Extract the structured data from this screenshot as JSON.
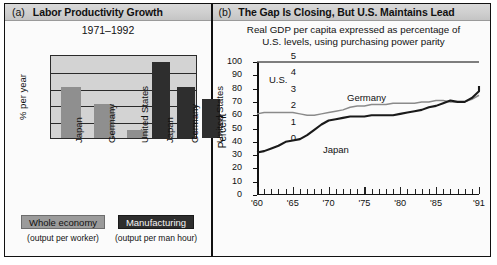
{
  "panel_a": {
    "letter": "(a)",
    "title": "Labor Productivity Growth",
    "subtitle": "1971–1992",
    "legend": {
      "whole_label": "Whole economy",
      "whole_sub": "(output per worker)",
      "manufacturing_label": "Manufacturing",
      "manufacturing_sub": "(output per man hour)"
    },
    "colors": {
      "whole": "#8f8f8f",
      "manufacturing": "#2e2e2e",
      "plot_bg": "#d3d3d3"
    }
  },
  "panel_b": {
    "letter": "(b)",
    "title": "The Gap Is Closing, But U.S. Maintains Lead",
    "subtitle_line1": "Real GDP per capita expressed as percentage of",
    "subtitle_line2": "U.S. levels, using purchasing power parity",
    "series_labels": {
      "us": "U.S.",
      "germany": "Germany",
      "japan": "Japan"
    }
  },
  "chart_data": [
    {
      "type": "bar",
      "title": "Labor Productivity Growth",
      "subtitle": "1971–1992",
      "xlabel": "",
      "ylabel": "% per year",
      "ylim": [
        0,
        5
      ],
      "yticks": [
        0,
        1,
        2,
        3,
        4,
        5
      ],
      "grid": true,
      "legend_position": "below",
      "categories": [
        "Japan",
        "Germany",
        "United States",
        "Japan",
        "Germany",
        "United States"
      ],
      "groups": [
        "Whole economy",
        "Whole economy",
        "Whole economy",
        "Manufacturing",
        "Manufacturing",
        "Manufacturing"
      ],
      "values": [
        3.05,
        2.0,
        0.45,
        4.5,
        3.05,
        2.3
      ],
      "series": [
        {
          "name": "Whole economy",
          "categories": [
            "Japan",
            "Germany",
            "United States"
          ],
          "values": [
            3.05,
            2.0,
            0.45
          ],
          "color": "#8f8f8f"
        },
        {
          "name": "Manufacturing",
          "categories": [
            "Japan",
            "Germany",
            "United States"
          ],
          "values": [
            4.5,
            3.05,
            2.3
          ],
          "color": "#2e2e2e"
        }
      ]
    },
    {
      "type": "line",
      "title": "The Gap Is Closing, But U.S. Maintains Lead",
      "subtitle": "Real GDP per capita expressed as percentage of U.S. levels, using purchasing power parity",
      "xlabel": "",
      "ylabel": "Percent",
      "ylim": [
        0,
        100
      ],
      "yticks": [
        0,
        10,
        20,
        30,
        40,
        50,
        60,
        70,
        80,
        90,
        100
      ],
      "xlim": [
        1960,
        1991
      ],
      "xticks": [
        1960,
        1965,
        1970,
        1975,
        1980,
        1985,
        1991
      ],
      "xticklabels": [
        "'60",
        "'65",
        "'70",
        "'75",
        "'80",
        "'85",
        "'91"
      ],
      "grid": false,
      "legend_position": "inline-annotation",
      "x": [
        1960,
        1961,
        1962,
        1963,
        1964,
        1965,
        1966,
        1967,
        1968,
        1969,
        1970,
        1971,
        1972,
        1973,
        1974,
        1975,
        1976,
        1977,
        1978,
        1979,
        1980,
        1981,
        1982,
        1983,
        1984,
        1985,
        1986,
        1987,
        1988,
        1989,
        1990,
        1991
      ],
      "series": [
        {
          "name": "U.S.",
          "values": [
            100,
            100,
            100,
            100,
            100,
            100,
            100,
            100,
            100,
            100,
            100,
            100,
            100,
            100,
            100,
            100,
            100,
            100,
            100,
            100,
            100,
            100,
            100,
            100,
            100,
            100,
            100,
            100,
            100,
            100,
            100,
            100
          ],
          "color": "#555555"
        },
        {
          "name": "Germany",
          "values": [
            61,
            62,
            62,
            62,
            62,
            62,
            61,
            60,
            60,
            61,
            62,
            63,
            64,
            66,
            67,
            67,
            68,
            68,
            68,
            69,
            69,
            69,
            69,
            70,
            70,
            71,
            71,
            70,
            70,
            70,
            72,
            75
          ],
          "color": "#8a8a8a"
        },
        {
          "name": "Japan",
          "values": [
            32,
            33,
            35,
            37,
            40,
            41,
            42,
            45,
            49,
            53,
            56,
            57,
            58,
            59,
            59,
            59,
            60,
            60,
            60,
            60,
            61,
            62,
            63,
            64,
            66,
            67,
            69,
            71,
            70,
            70,
            73,
            78,
            82
          ],
          "color": "#1a1a1a"
        }
      ]
    }
  ]
}
